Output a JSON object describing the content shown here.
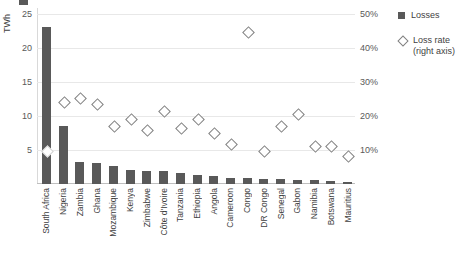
{
  "legend": {
    "losses_label": "Losses",
    "lossrate_label": "Loss rate\n(right axis)",
    "lossrate_line1": "Loss rate",
    "lossrate_line2": "(right axis)"
  },
  "axes": {
    "left_title": "TWh",
    "left_ticks": [
      "25",
      "20",
      "15",
      "10",
      "5"
    ],
    "right_ticks": [
      "50%",
      "40%",
      "30%",
      "20%",
      "10%"
    ]
  },
  "chart_data": {
    "type": "bar",
    "title": "",
    "subtitle": "",
    "xlabel": "",
    "ylabel": "TWh",
    "y2label": "Loss rate (right axis)",
    "ylim": [
      0,
      25
    ],
    "y2lim": [
      0,
      50
    ],
    "yticks": [
      5,
      10,
      15,
      20,
      25
    ],
    "y2ticks": [
      10,
      20,
      30,
      40,
      50
    ],
    "grid": true,
    "legend_position": "right",
    "categories": [
      "South Africa",
      "Nigeria",
      "Zambia",
      "Ghana",
      "Mozambique",
      "Kenya",
      "Zimbabwe",
      "Côte d'Ivoire",
      "Tanzania",
      "Ethiopia",
      "Angola",
      "Cameroon",
      "Congo",
      "DR Congo",
      "Senegal",
      "Gabon",
      "Namibia",
      "Botswana",
      "Mauritius"
    ],
    "series": [
      {
        "name": "Losses",
        "type": "bar",
        "axis": "left",
        "unit": "TWh",
        "color": "#595959",
        "values": [
          22.3,
          8.3,
          3.1,
          3.0,
          2.6,
          2.0,
          1.9,
          1.8,
          1.5,
          1.3,
          1.1,
          0.8,
          0.8,
          0.7,
          0.7,
          0.6,
          0.5,
          0.4,
          0.3
        ]
      },
      {
        "name": "Loss rate (right axis)",
        "type": "scatter",
        "axis": "right",
        "unit": "%",
        "marker": "diamond",
        "color": "#808080",
        "values": [
          9.5,
          23.5,
          24.5,
          23.0,
          16.5,
          18.5,
          15.5,
          21.0,
          16.0,
          18.5,
          14.5,
          11.5,
          43.2,
          9.5,
          16.5,
          20.0,
          11.0,
          11.0,
          8.0
        ]
      }
    ]
  }
}
